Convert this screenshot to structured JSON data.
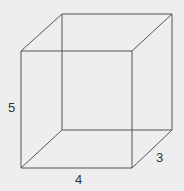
{
  "diagram": {
    "type": "rectangular-prism-wireframe",
    "labels": {
      "height": "5",
      "width": "4",
      "depth": "3"
    },
    "colors": {
      "background": "#eeeeee",
      "line": "#555555",
      "text": "#333333"
    }
  }
}
